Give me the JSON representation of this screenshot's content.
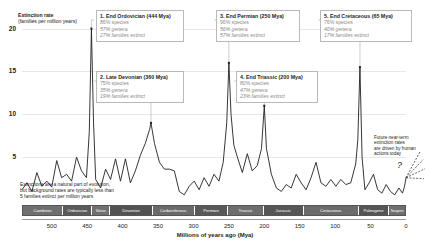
{
  "chart_data": {
    "type": "line",
    "title": "",
    "ylabel": "Extinction rate",
    "ylabel_sub": "(families per million years)",
    "xlabel": "Millions of years ago (Mya)",
    "ylim": [
      0,
      21
    ],
    "xlim": [
      542,
      0
    ],
    "yticks": [
      5,
      10,
      15,
      20
    ],
    "xticks": [
      500,
      450,
      400,
      350,
      300,
      250,
      200,
      150,
      100,
      50,
      0
    ],
    "grid": true,
    "legend": "none",
    "series_name": "Extinction rate",
    "line_color": "#231f20",
    "points": [
      [
        542,
        1.2
      ],
      [
        535,
        2.0
      ],
      [
        528,
        1.0
      ],
      [
        521,
        3.2
      ],
      [
        514,
        1.6
      ],
      [
        507,
        2.2
      ],
      [
        500,
        1.5
      ],
      [
        493,
        4.6
      ],
      [
        486,
        2.6
      ],
      [
        479,
        3.0
      ],
      [
        472,
        2.2
      ],
      [
        465,
        5.0
      ],
      [
        458,
        3.4
      ],
      [
        451,
        2.6
      ],
      [
        447,
        8.0
      ],
      [
        444,
        20.0
      ],
      [
        441,
        9.0
      ],
      [
        438,
        2.4
      ],
      [
        431,
        1.4
      ],
      [
        424,
        3.6
      ],
      [
        417,
        2.4
      ],
      [
        410,
        4.8
      ],
      [
        403,
        2.2
      ],
      [
        396,
        4.8
      ],
      [
        389,
        2.0
      ],
      [
        382,
        3.4
      ],
      [
        375,
        5.2
      ],
      [
        368,
        6.6
      ],
      [
        362,
        8.2
      ],
      [
        360,
        9.0
      ],
      [
        355,
        6.6
      ],
      [
        348,
        4.4
      ],
      [
        341,
        3.6
      ],
      [
        334,
        3.6
      ],
      [
        327,
        3.4
      ],
      [
        320,
        1.0
      ],
      [
        313,
        0.6
      ],
      [
        306,
        1.6
      ],
      [
        299,
        2.2
      ],
      [
        292,
        1.2
      ],
      [
        285,
        2.6
      ],
      [
        278,
        1.6
      ],
      [
        271,
        3.0
      ],
      [
        264,
        2.2
      ],
      [
        258,
        4.4
      ],
      [
        253,
        9.0
      ],
      [
        250,
        16.0
      ],
      [
        247,
        10.0
      ],
      [
        243,
        6.4
      ],
      [
        238,
        5.0
      ],
      [
        231,
        3.2
      ],
      [
        224,
        5.4
      ],
      [
        217,
        3.4
      ],
      [
        210,
        4.0
      ],
      [
        204,
        6.0
      ],
      [
        200,
        11.0
      ],
      [
        197,
        6.0
      ],
      [
        190,
        3.0
      ],
      [
        183,
        1.4
      ],
      [
        176,
        1.0
      ],
      [
        169,
        1.8
      ],
      [
        162,
        1.4
      ],
      [
        155,
        3.0
      ],
      [
        148,
        2.0
      ],
      [
        141,
        1.2
      ],
      [
        134,
        2.6
      ],
      [
        127,
        4.4
      ],
      [
        120,
        2.0
      ],
      [
        113,
        1.6
      ],
      [
        106,
        2.4
      ],
      [
        99,
        1.6
      ],
      [
        92,
        2.4
      ],
      [
        85,
        1.8
      ],
      [
        78,
        2.0
      ],
      [
        71,
        4.2
      ],
      [
        68,
        7.0
      ],
      [
        65,
        15.5
      ],
      [
        62,
        5.0
      ],
      [
        58,
        1.2
      ],
      [
        52,
        2.0
      ],
      [
        46,
        3.0
      ],
      [
        40,
        1.2
      ],
      [
        34,
        0.8
      ],
      [
        28,
        1.8
      ],
      [
        22,
        1.0
      ],
      [
        16,
        0.6
      ],
      [
        10,
        1.4
      ],
      [
        5,
        0.8
      ],
      [
        2,
        1.6
      ],
      [
        0,
        2.6
      ]
    ],
    "future_trend": {
      "style": "dashed",
      "label": "Future near-term extinction rates are driven by human actions today",
      "marker": "?"
    },
    "annotations": [
      {
        "id": 1,
        "title": "1. End Ordovician (444 Mya)",
        "lines": [
          "86% species",
          "57% genera",
          "27% families extinct"
        ],
        "x_mya": 444,
        "peak": 20.0
      },
      {
        "id": 2,
        "title": "2. Late Devonian (360 Mya)",
        "lines": [
          "75% species",
          "35% genera",
          "19% families extinct"
        ],
        "x_mya": 360,
        "peak": 9.0
      },
      {
        "id": 3,
        "title": "3. End Permian (250 Mya)",
        "lines": [
          "96% species",
          "56% genera",
          "57% families extinct"
        ],
        "x_mya": 250,
        "peak": 16.0
      },
      {
        "id": 4,
        "title": "4. End Triassic (200 Mya)",
        "lines": [
          "80% species",
          "47% genera",
          "23% families extinct"
        ],
        "x_mya": 200,
        "peak": 11.0
      },
      {
        "id": 5,
        "title": "5. End Cretaceous (65 Mya)",
        "lines": [
          "76% species",
          "40% genera",
          "17% families extinct"
        ],
        "x_mya": 65,
        "peak": 15.5
      }
    ],
    "background_note": "Extinctions are a natural part of evolution, but background rates are typically less than 5 families extinct per million years",
    "background_note_lines": [
      "Extinctions are a natural part of evolution,",
      "but background rates are typically less than",
      "5 families extinct per million years"
    ],
    "future_note_lines": [
      "Future near-term",
      "extinction rates",
      "are driven by human",
      "actions today"
    ],
    "periods": [
      {
        "name": "Cambrian",
        "start": 542,
        "end": 485,
        "color": "#6f6f6f"
      },
      {
        "name": "Ordovician",
        "start": 485,
        "end": 444,
        "color": "#5a5a5a"
      },
      {
        "name": "Silurian",
        "start": 444,
        "end": 419,
        "color": "#707070"
      },
      {
        "name": "Devonian",
        "start": 419,
        "end": 359,
        "color": "#525252"
      },
      {
        "name": "Carboniferous",
        "start": 359,
        "end": 299,
        "color": "#6a6a6a"
      },
      {
        "name": "Permian",
        "start": 299,
        "end": 252,
        "color": "#585858"
      },
      {
        "name": "Triassic",
        "start": 252,
        "end": 201,
        "color": "#6d6d6d"
      },
      {
        "name": "Jurassic",
        "start": 201,
        "end": 145,
        "color": "#565656"
      },
      {
        "name": "Cretaceous",
        "start": 145,
        "end": 66,
        "color": "#6b6b6b"
      },
      {
        "name": "Paleogene",
        "start": 66,
        "end": 23,
        "color": "#545454"
      },
      {
        "name": "Neogene",
        "start": 23,
        "end": 0,
        "color": "#6e6e6e"
      }
    ]
  }
}
